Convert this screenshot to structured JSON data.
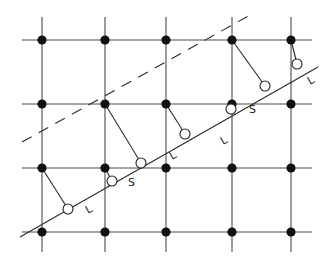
{
  "figure": {
    "width": 335,
    "height": 261,
    "colors": {
      "background": "#ffffff",
      "line": "#2a2a2a",
      "filled_node": "#111111",
      "open_node_fill": "#ffffff"
    }
  },
  "grid": {
    "columns_x": [
      42,
      105,
      166,
      232,
      291
    ],
    "rows_y": [
      40,
      104,
      168,
      232
    ],
    "x_extent": [
      22,
      312
    ],
    "y_extent": [
      17,
      252
    ]
  },
  "solid_line": {
    "x1": 20,
    "y1": 237,
    "x2": 318,
    "y2": 67
  },
  "dashed_line": {
    "x1": 22,
    "y1": 142,
    "x2": 252,
    "y2": 14
  },
  "open_nodes": [
    {
      "x": 68,
      "y": 209
    },
    {
      "x": 112,
      "y": 181
    },
    {
      "x": 141,
      "y": 163
    },
    {
      "x": 185,
      "y": 134
    },
    {
      "x": 231,
      "y": 109
    },
    {
      "x": 265,
      "y": 86
    },
    {
      "x": 297,
      "y": 64
    }
  ],
  "links": [
    {
      "from": [
        42,
        168
      ],
      "to": [
        68,
        209
      ]
    },
    {
      "from": [
        105,
        168
      ],
      "to": [
        112,
        181
      ]
    },
    {
      "from": [
        105,
        104
      ],
      "to": [
        141,
        163
      ]
    },
    {
      "from": [
        166,
        104
      ],
      "to": [
        185,
        134
      ]
    },
    {
      "from": [
        232,
        40
      ],
      "to": [
        265,
        86
      ]
    },
    {
      "from": [
        291,
        40
      ],
      "to": [
        297,
        64
      ]
    }
  ],
  "labels": [
    {
      "text": "L",
      "x": 88,
      "y": 214,
      "rotate": -30
    },
    {
      "text": "S",
      "x": 128,
      "y": 186,
      "rotate": 0
    },
    {
      "text": "L",
      "x": 172,
      "y": 160,
      "rotate": -30
    },
    {
      "text": "L",
      "x": 223,
      "y": 145,
      "rotate": -30
    },
    {
      "text": "S",
      "x": 249,
      "y": 113,
      "rotate": 0
    },
    {
      "text": "L",
      "x": 310,
      "y": 85,
      "rotate": -30
    }
  ]
}
